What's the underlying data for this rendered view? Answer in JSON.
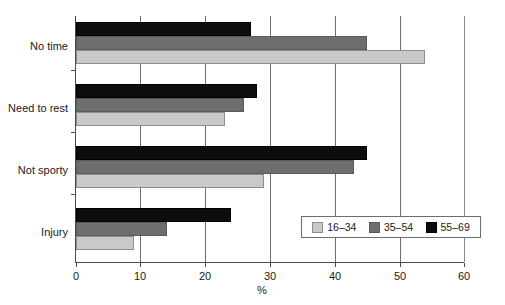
{
  "chart_data": {
    "type": "bar",
    "orientation": "horizontal",
    "title": "",
    "xlabel": "%",
    "ylabel": "",
    "xlim": [
      0,
      60
    ],
    "xticks": [
      0,
      10,
      20,
      30,
      40,
      50,
      60
    ],
    "xtick_labels": [
      "0",
      "10",
      "20",
      "30",
      "40",
      "50",
      "60"
    ],
    "grid": true,
    "grid_axis": "x",
    "legend_position": "lower right",
    "categories": [
      "No time",
      "Need to rest",
      "Not sporty",
      "Injury"
    ],
    "series": [
      {
        "name": "16–34",
        "color": "#c9c9c9",
        "values": [
          54,
          23,
          29,
          9
        ]
      },
      {
        "name": "35–54",
        "color": "#6e6e6e",
        "values": [
          45,
          26,
          43,
          14
        ]
      },
      {
        "name": "55–69",
        "color": "#0d0d0d",
        "values": [
          27,
          28,
          45,
          24
        ]
      }
    ]
  },
  "axis": {
    "x_title": "%",
    "tick_labels": [
      "0",
      "10",
      "20",
      "30",
      "40",
      "50",
      "60"
    ],
    "category_labels": [
      "No time",
      "Need to rest",
      "Not sporty",
      "Injury"
    ]
  },
  "legend": {
    "items": [
      {
        "label": "16–34"
      },
      {
        "label": "35–54"
      },
      {
        "label": "55–69"
      }
    ]
  }
}
